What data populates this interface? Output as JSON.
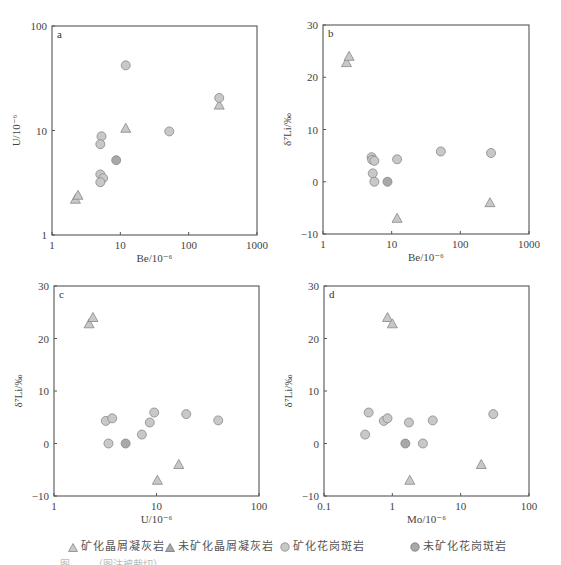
{
  "colors": {
    "frame": "#555555",
    "marker_light": "#c8c8c8",
    "marker_dark": "#a8a8a8",
    "marker_stroke": "#888888",
    "text": "#444444"
  },
  "legend": {
    "items": [
      {
        "label": "矿化晶屑凝灰岩",
        "symbol": "triangle",
        "shade": "light"
      },
      {
        "label": "未矿化晶屑凝灰岩",
        "symbol": "triangle",
        "shade": "dark"
      },
      {
        "label": "矿化花岗斑岩",
        "symbol": "circle",
        "shade": "light"
      },
      {
        "label": "未矿化花岗斑岩",
        "symbol": "circle",
        "shade": "dark"
      }
    ]
  },
  "caption": "图  ……（图注被裁切）",
  "chart_data": [
    {
      "type": "scatter",
      "panel": "a",
      "xlabel": "Be/10⁻⁶",
      "ylabel": "U/10⁻⁶",
      "xscale": "log",
      "yscale": "log",
      "xlim": [
        1,
        1000
      ],
      "ylim": [
        1,
        100
      ],
      "xticks": [
        "1",
        "10",
        "100",
        "1000"
      ],
      "yticks": [
        "1",
        "10",
        "100"
      ],
      "grid": false,
      "frame": {
        "x0": 52,
        "y0": 26,
        "x1": 257,
        "y1": 235
      },
      "series": [
        {
          "name": "矿化晶屑凝灰岩",
          "marker": "triangle",
          "shade": "light",
          "points": [
            [
              2.2,
              2.2
            ],
            [
              2.4,
              2.4
            ],
            [
              12,
              10.5
            ],
            [
              280,
              17.5
            ]
          ]
        },
        {
          "name": "矿化花岗斑岩",
          "marker": "circle",
          "shade": "light",
          "points": [
            [
              12,
              42
            ],
            [
              5.3,
              8.8
            ],
            [
              5.1,
              7.4
            ],
            [
              280,
              20.5
            ],
            [
              52,
              9.8
            ],
            [
              5.1,
              3.8
            ],
            [
              5.6,
              3.5
            ],
            [
              5.1,
              3.2
            ]
          ]
        },
        {
          "name": "未矿化花岗斑岩",
          "marker": "circle",
          "shade": "dark",
          "points": [
            [
              8.7,
              5.2
            ]
          ]
        }
      ]
    },
    {
      "type": "scatter",
      "panel": "b",
      "xlabel": "Be/10⁻⁶",
      "ylabel": "δ⁷Li/‰",
      "xscale": "log",
      "yscale": "linear",
      "xlim": [
        1,
        1000
      ],
      "ylim": [
        -10,
        30
      ],
      "xticks": [
        "1",
        "10",
        "100",
        "1000"
      ],
      "yticks": [
        "-10",
        "0",
        "10",
        "20",
        "30"
      ],
      "grid": false,
      "frame": {
        "x0": 323,
        "y0": 25,
        "x1": 529,
        "y1": 234
      },
      "series": [
        {
          "name": "矿化晶屑凝灰岩",
          "marker": "triangle",
          "shade": "light",
          "points": [
            [
              2.2,
              22.8
            ],
            [
              2.4,
              24
            ],
            [
              12,
              -7
            ],
            [
              270,
              -4
            ]
          ]
        },
        {
          "name": "矿化花岗斑岩",
          "marker": "circle",
          "shade": "light",
          "points": [
            [
              5.1,
              4.7
            ],
            [
              5.2,
              4.2
            ],
            [
              5.6,
              4.0
            ],
            [
              12,
              4.3
            ],
            [
              52,
              5.8
            ],
            [
              280,
              5.5
            ],
            [
              5.3,
              1.6
            ],
            [
              5.6,
              0
            ]
          ]
        },
        {
          "name": "未矿化花岗斑岩",
          "marker": "circle",
          "shade": "dark",
          "points": [
            [
              8.7,
              0
            ]
          ]
        }
      ]
    },
    {
      "type": "scatter",
      "panel": "c",
      "xlabel": "U/10⁻⁶",
      "ylabel": "δ⁷Li/‰",
      "xscale": "log",
      "yscale": "linear",
      "xlim": [
        1,
        100
      ],
      "ylim": [
        -10,
        30
      ],
      "xticks": [
        "1",
        "10",
        "100"
      ],
      "yticks": [
        "-10",
        "0",
        "10",
        "20",
        "30"
      ],
      "grid": false,
      "frame": {
        "x0": 54,
        "y0": 286,
        "x1": 259,
        "y1": 496
      },
      "series": [
        {
          "name": "矿化晶屑凝灰岩",
          "marker": "triangle",
          "shade": "light",
          "points": [
            [
              2.2,
              22.8
            ],
            [
              2.4,
              24
            ],
            [
              10.2,
              -7
            ],
            [
              16.5,
              -4
            ]
          ]
        },
        {
          "name": "矿化花岗斑岩",
          "marker": "circle",
          "shade": "light",
          "points": [
            [
              3.2,
              4.3
            ],
            [
              3.7,
              4.8
            ],
            [
              3.4,
              0
            ],
            [
              7.2,
              1.7
            ],
            [
              8.6,
              4.0
            ],
            [
              9.5,
              5.9
            ],
            [
              19.5,
              5.6
            ],
            [
              40,
              4.4
            ]
          ]
        },
        {
          "name": "未矿化花岗斑岩",
          "marker": "circle",
          "shade": "dark",
          "points": [
            [
              5.0,
              0
            ]
          ]
        }
      ]
    },
    {
      "type": "scatter",
      "panel": "d",
      "xlabel": "Mo/10⁻⁶",
      "ylabel": "δ⁷Li/‰",
      "xscale": "log",
      "yscale": "linear",
      "xlim": [
        0.1,
        100
      ],
      "ylim": [
        -10,
        30
      ],
      "xticks": [
        "0.1",
        "1",
        "10",
        "100"
      ],
      "yticks": [
        "-10",
        "0",
        "10",
        "20",
        "30"
      ],
      "grid": false,
      "frame": {
        "x0": 324,
        "y0": 286,
        "x1": 529,
        "y1": 496
      },
      "series": [
        {
          "name": "矿化晶屑凝灰岩",
          "marker": "triangle",
          "shade": "light",
          "points": [
            [
              0.85,
              24
            ],
            [
              1.0,
              22.8
            ],
            [
              1.8,
              -7
            ],
            [
              20,
              -4
            ]
          ]
        },
        {
          "name": "矿化花岗斑岩",
          "marker": "circle",
          "shade": "light",
          "points": [
            [
              0.45,
              5.9
            ],
            [
              0.4,
              1.7
            ],
            [
              0.75,
              4.3
            ],
            [
              0.85,
              4.8
            ],
            [
              1.75,
              4.0
            ],
            [
              2.8,
              0
            ],
            [
              3.9,
              4.4
            ],
            [
              30,
              5.6
            ]
          ]
        },
        {
          "name": "未矿化花岗斑岩",
          "marker": "circle",
          "shade": "dark",
          "points": [
            [
              1.55,
              0
            ]
          ]
        }
      ]
    }
  ]
}
